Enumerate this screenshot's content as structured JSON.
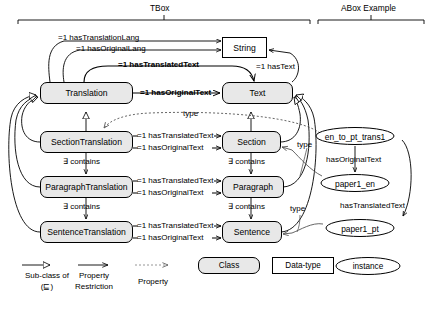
{
  "sections": {
    "tbox_label": "TBox",
    "abox_label": "ABox Example"
  },
  "classes": [
    {
      "id": "translation",
      "label": "Translation"
    },
    {
      "id": "text",
      "label": "Text"
    },
    {
      "id": "section_translation",
      "label": "SectionTranslation"
    },
    {
      "id": "section",
      "label": "Section"
    },
    {
      "id": "paragraph_translation",
      "label": "ParagraphTranslation"
    },
    {
      "id": "paragraph",
      "label": "Paragraph"
    },
    {
      "id": "sentence_translation",
      "label": "SentenceTranslation"
    },
    {
      "id": "sentence",
      "label": "Sentence"
    }
  ],
  "datatypes": [
    {
      "id": "string",
      "label": "String"
    }
  ],
  "instances": [
    {
      "id": "en_to_pt_trans1",
      "label": "en_to_pt_trans1"
    },
    {
      "id": "paper1_en",
      "label": "paper1_en"
    },
    {
      "id": "paper1_pt",
      "label": "paper1_pt"
    }
  ],
  "restrictions": {
    "has_translation_lang": "=1 hasTranslationLang",
    "has_original_lang": "=1 hasOriginalLang",
    "has_translated_text": "=1 hasTranslatedText",
    "has_original_text": "=1 hasOriginalText",
    "has_text": "=1 hasText",
    "contains": "∃ contains"
  },
  "edge_labels": {
    "translation_has_original_text": "=1 hasOriginalText",
    "translation_has_translated_text": "=1 hasTranslatedText",
    "translation_has_translation_lang": "=1 hasTranslationLang",
    "translation_has_original_lang": "=1 hasOriginalLang",
    "text_has_text": "=1 hasText",
    "section_translated": "=1 hasTranslatedText",
    "section_original": "=1 hasOriginalText",
    "paragraph_translated": "=1 hasTranslatedText",
    "paragraph_original": "=1 hasOriginalText",
    "sentence_translated": "=1 hasTranslatedText",
    "sentence_original": "=1 hasOriginalText",
    "contains_section": "∃ contains",
    "contains_section_right": "∃ contains",
    "contains_paragraph": "∃ contains",
    "contains_paragraph_right": "∃ contains",
    "type_translation": "type",
    "type_section": "type",
    "type_sentence": "type",
    "abox_has_original_text": "hasOriginalText",
    "abox_has_translated_text": "hasTranslatedText"
  },
  "legend": {
    "subclass_line1": "Sub-class of",
    "subclass_line2": "(⊑)",
    "property_restriction_line1": "Property",
    "property_restriction_line2": "Restriction",
    "property": "Property",
    "class": "Class",
    "datatype": "Data-type",
    "instance": "instance"
  },
  "colors": {
    "class_fill": "#e8e8e8",
    "datatype_fill": "#ffffff",
    "instance_fill": "#ffffff",
    "stroke": "#000000",
    "background": "#ffffff"
  }
}
